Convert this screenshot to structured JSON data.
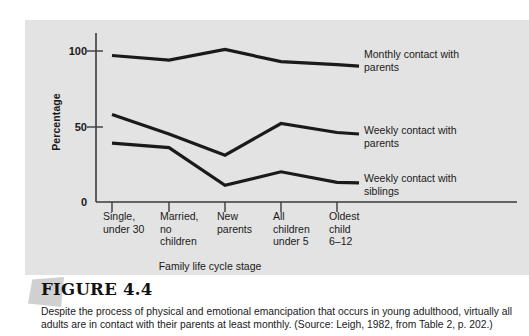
{
  "figure": {
    "title": "FIGURE 4.4",
    "caption": "Despite the process of physical and emotional emancipation that occurs in young adulthood, virtually all adults are in contact with their parents at least monthly. (Source: Leigh, 1982, from Table 2, p. 202.)"
  },
  "colors": {
    "panel_background": "#e3e3e3",
    "page_background": "#ffffff",
    "line": "#1a1a1a",
    "axis": "#3a3a3a",
    "text": "#1a1a1a",
    "corner_decor": "#c8c8c8"
  },
  "chart_data": {
    "type": "line",
    "title": "",
    "xlabel": "Family life cycle stage",
    "ylabel": "Percentage",
    "ylim": [
      0,
      110
    ],
    "yticks": [
      0,
      50,
      100
    ],
    "ytick_labels": [
      "0",
      "50",
      "100"
    ],
    "grid": false,
    "legend_position": "right-inline",
    "categories": [
      "Single,\nunder 30",
      "Married,\nno\nchildren",
      "New\nparents",
      "All\nchildren\nunder 5",
      "Oldest\nchild\n6–12"
    ],
    "series": [
      {
        "name": "Monthly contact with\nparents",
        "values": [
          97,
          94,
          101,
          93,
          91
        ]
      },
      {
        "name": "Weekly contact with\nparents",
        "values": [
          58,
          45,
          31,
          52,
          46
        ]
      },
      {
        "name": "Weekly contact with\nsiblings",
        "values": [
          39,
          36,
          11,
          20,
          13
        ]
      }
    ]
  }
}
